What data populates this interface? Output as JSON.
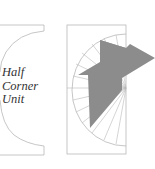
{
  "diagram": {
    "title": "Half Corner Unit",
    "label_lines": [
      "Half",
      "Corner",
      "Unit"
    ],
    "colors": {
      "outline": "#b8b8b8",
      "fill": "#8c8c8c",
      "text": "#333333",
      "background": "#ffffff"
    },
    "left_panel": {
      "name": "half-corner-unit-plan"
    },
    "right_panel": {
      "name": "spiral-stair-plan",
      "tread_count": 14
    }
  }
}
